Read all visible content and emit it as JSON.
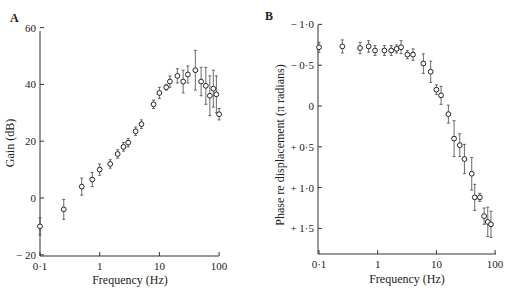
{
  "panels": {
    "a": {
      "label": "A",
      "ylabel": "Gain (dB)",
      "xlabel": "Frequency (Hz)",
      "yticks": [
        "60",
        "40",
        "20",
        "0",
        "− 20"
      ],
      "xticks": [
        "0·1",
        "1",
        "10",
        "100"
      ]
    },
    "b": {
      "label": "B",
      "ylabel": "Phase re displacement (π radians)",
      "xlabel": "Frequency (Hz)",
      "yticks": [
        "− 1·0",
        "− 0·5",
        "0",
        "+ 0·5",
        "+ 1·0",
        "+ 1·5"
      ],
      "xticks": [
        "0·1",
        "1",
        "10",
        "100"
      ]
    }
  },
  "chart_data": [
    {
      "type": "scatter",
      "title": "A",
      "xlabel": "Frequency (Hz)",
      "ylabel": "Gain (dB)",
      "xscale": "log",
      "xlim": [
        0.1,
        100
      ],
      "ylim": [
        -20,
        60
      ],
      "xticks": [
        0.1,
        1,
        10,
        100
      ],
      "yticks": [
        -20,
        0,
        20,
        40,
        60
      ],
      "grid": false,
      "marker": "open-circle",
      "error_bars": true,
      "x": [
        0.1,
        0.25,
        0.5,
        0.75,
        1.0,
        1.5,
        2.0,
        2.5,
        3.0,
        4.0,
        5.0,
        8.0,
        10,
        13,
        15,
        20,
        25,
        30,
        40,
        50,
        60,
        70,
        80,
        90,
        100
      ],
      "y": [
        -10,
        -4,
        4,
        6.5,
        10,
        12,
        15.5,
        18,
        19.5,
        23.5,
        26,
        33,
        37,
        39,
        41,
        43,
        41,
        43.5,
        45,
        41,
        39.5,
        36,
        38.5,
        36.5,
        29.5
      ],
      "err": [
        3,
        3.5,
        3,
        2.5,
        2,
        1.5,
        1.5,
        1.5,
        1.5,
        1.5,
        1.5,
        1.5,
        2,
        1,
        2,
        2.5,
        4,
        3,
        7,
        5,
        6.5,
        7,
        6.5,
        6.5,
        2
      ]
    },
    {
      "type": "scatter",
      "title": "B",
      "xlabel": "Frequency (Hz)",
      "ylabel": "Phase re displacement (π radians)",
      "xscale": "log",
      "xlim": [
        0.1,
        100
      ],
      "ylim": [
        -1.0,
        1.8
      ],
      "y_inverted": true,
      "xticks": [
        0.1,
        1,
        10,
        100
      ],
      "yticks": [
        -1.0,
        -0.5,
        0,
        0.5,
        1.0,
        1.5
      ],
      "grid": false,
      "marker": "open-circle",
      "error_bars": true,
      "x": [
        0.1,
        0.25,
        0.5,
        0.7,
        0.9,
        1.3,
        1.7,
        2.1,
        2.5,
        3.2,
        4.0,
        6.0,
        8.0,
        10,
        12,
        16,
        20,
        25,
        30,
        40,
        45,
        55,
        65,
        75,
        85
      ],
      "y": [
        -0.72,
        -0.73,
        -0.71,
        -0.73,
        -0.68,
        -0.68,
        -0.68,
        -0.7,
        -0.72,
        -0.63,
        -0.63,
        -0.52,
        -0.42,
        -0.2,
        -0.13,
        0.1,
        0.4,
        0.48,
        0.65,
        0.83,
        1.12,
        1.12,
        1.35,
        1.42,
        1.45
      ],
      "err": [
        0.06,
        0.08,
        0.07,
        0.07,
        0.06,
        0.06,
        0.06,
        0.05,
        0.08,
        0.05,
        0.07,
        0.12,
        0.13,
        0.06,
        0.11,
        0.11,
        0.22,
        0.14,
        0.18,
        0.2,
        0.16,
        0.05,
        0.1,
        0.18,
        0.16
      ]
    }
  ]
}
